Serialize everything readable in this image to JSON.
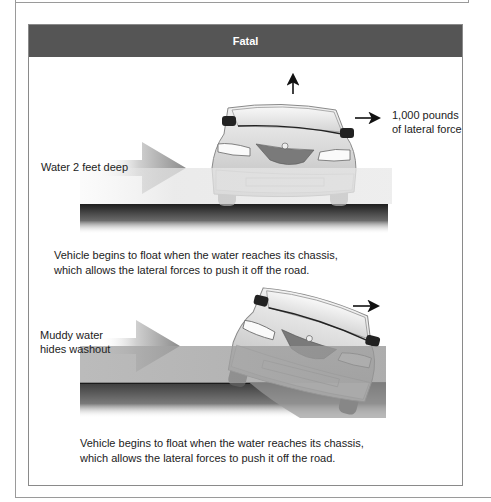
{
  "header": {
    "title": "Fatal"
  },
  "scene1": {
    "water_label": "Water 2 feet deep",
    "force_label_line1": "1,000 pounds",
    "force_label_line2": "of lateral force",
    "caption_line1": "Vehicle begins to float when the water reaches its chassis,",
    "caption_line2": "which allows the lateral forces to push it off the road.",
    "water_color": "#e8e8e8",
    "road_color": "#2a2a2a"
  },
  "scene2": {
    "water_label_line1": "Muddy water",
    "water_label_line2": "hides washout",
    "caption_line1": "Vehicle begins to float when the water reaches its chassis,",
    "caption_line2": "which allows the lateral forces to push it off the road.",
    "water_color": "#9c9c9c",
    "road_color": "#2a2a2a"
  },
  "colors": {
    "header_bg": "#555555",
    "header_text": "#ffffff",
    "frame_border": "#9a9a9a"
  }
}
